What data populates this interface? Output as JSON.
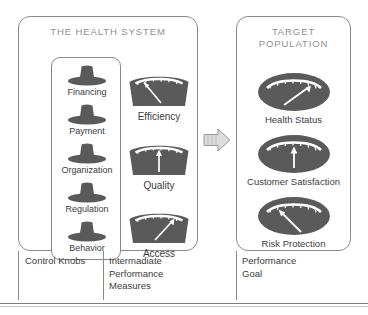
{
  "figure": {
    "colors": {
      "shape_fill": "#5a5a5a",
      "panel_border": "#8a8a8a",
      "title_text": "#8f8f8f",
      "label_text": "#3c3c3c",
      "arrow_fill": "#dcdcdc",
      "arrow_stroke": "#9a9a9a",
      "marker_white": "#ffffff"
    }
  },
  "health_system": {
    "title": "THE HEALTH SYSTEM",
    "control_knobs": [
      {
        "label": "Financing",
        "icon": "knob-icon",
        "top": 6
      },
      {
        "label": "Payment",
        "icon": "knob-icon",
        "top": 45
      },
      {
        "label": "Organization",
        "icon": "knob-icon",
        "top": 84
      },
      {
        "label": "Regulation",
        "icon": "knob-icon",
        "top": 123
      },
      {
        "label": "Behavior",
        "icon": "knob-icon",
        "top": 162
      }
    ],
    "intermediate_measures": [
      {
        "label": "Efficiency",
        "icon": "gauge-icon",
        "needle": "up-left",
        "top": 53
      },
      {
        "label": "Quality",
        "icon": "gauge-icon",
        "needle": "up",
        "top": 122
      },
      {
        "label": "Access",
        "icon": "gauge-icon",
        "needle": "up-right",
        "top": 190
      }
    ]
  },
  "target_population": {
    "title": "TARGET\nPOPULATION",
    "outcomes": [
      {
        "label": "Health Status",
        "icon": "oval-gauge-icon",
        "needle": "up-right",
        "top": 55
      },
      {
        "label": "Customer Satisfaction",
        "icon": "oval-gauge-icon",
        "needle": "up",
        "top": 117
      },
      {
        "label": "Risk Protection",
        "icon": "oval-gauge-icon",
        "needle": "up-left",
        "top": 179
      }
    ]
  },
  "flow": {
    "arrow": "right-arrow-icon"
  },
  "captions": {
    "control_knobs": "Control Knobs",
    "intermediate": "Intermadiate\nPerformance\nMeasures",
    "performance_goal": "Performance\nGoal"
  }
}
